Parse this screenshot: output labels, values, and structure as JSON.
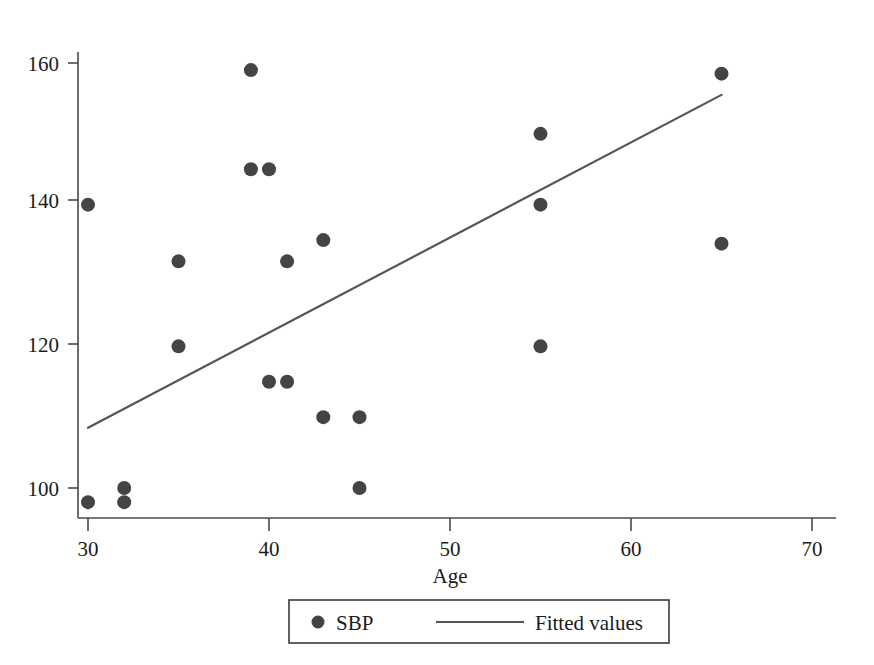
{
  "chart_data": {
    "type": "scatter",
    "title": "",
    "xlabel": "Age",
    "ylabel": "",
    "xlim": [
      29,
      71
    ],
    "ylim": [
      96,
      162
    ],
    "xticks": [
      30,
      40,
      50,
      60,
      70
    ],
    "yticks": [
      100,
      120,
      140,
      160
    ],
    "xtick_labels": [
      "30",
      "40",
      "50",
      "60",
      "70"
    ],
    "ytick_labels": [
      "100",
      "120",
      "140",
      "160"
    ],
    "grid": false,
    "legend_position": "bottom-center",
    "series": [
      {
        "name": "SBP",
        "type": "scatter",
        "marker": "circle",
        "color": "#444444",
        "points": [
          {
            "x": 30,
            "y": 140
          },
          {
            "x": 30,
            "y": 98
          },
          {
            "x": 32,
            "y": 100
          },
          {
            "x": 32,
            "y": 98
          },
          {
            "x": 35,
            "y": 132
          },
          {
            "x": 35,
            "y": 120
          },
          {
            "x": 39,
            "y": 159
          },
          {
            "x": 39,
            "y": 145
          },
          {
            "x": 40,
            "y": 145
          },
          {
            "x": 40,
            "y": 115
          },
          {
            "x": 41,
            "y": 132
          },
          {
            "x": 41,
            "y": 115
          },
          {
            "x": 43,
            "y": 135
          },
          {
            "x": 43,
            "y": 110
          },
          {
            "x": 45,
            "y": 110
          },
          {
            "x": 45,
            "y": 100
          },
          {
            "x": 55,
            "y": 150
          },
          {
            "x": 55,
            "y": 140
          },
          {
            "x": 55,
            "y": 120
          },
          {
            "x": 65,
            "y": 158.5
          },
          {
            "x": 65,
            "y": 134.5
          }
        ]
      },
      {
        "name": "Fitted values",
        "type": "line",
        "color": "#555555",
        "endpoints": [
          {
            "x": 30,
            "y": 108.5
          },
          {
            "x": 65,
            "y": 155.5
          }
        ]
      }
    ]
  },
  "legend": {
    "items": [
      {
        "label": "SBP",
        "symbol": "circle-marker"
      },
      {
        "label": "Fitted values",
        "symbol": "line-segment"
      }
    ]
  },
  "colors": {
    "marker": "#444444",
    "line": "#555555",
    "axis": "#4a4a4a",
    "text": "#1b1b1b",
    "background": "#ffffff"
  }
}
